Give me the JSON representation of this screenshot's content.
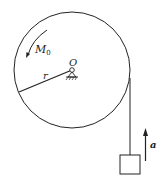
{
  "diagram": {
    "labels": {
      "moment": "M",
      "moment_sub": "0",
      "center": "O",
      "radius": "r",
      "acceleration": "a"
    },
    "colors": {
      "stroke": "#222222",
      "background": "#ffffff"
    }
  }
}
